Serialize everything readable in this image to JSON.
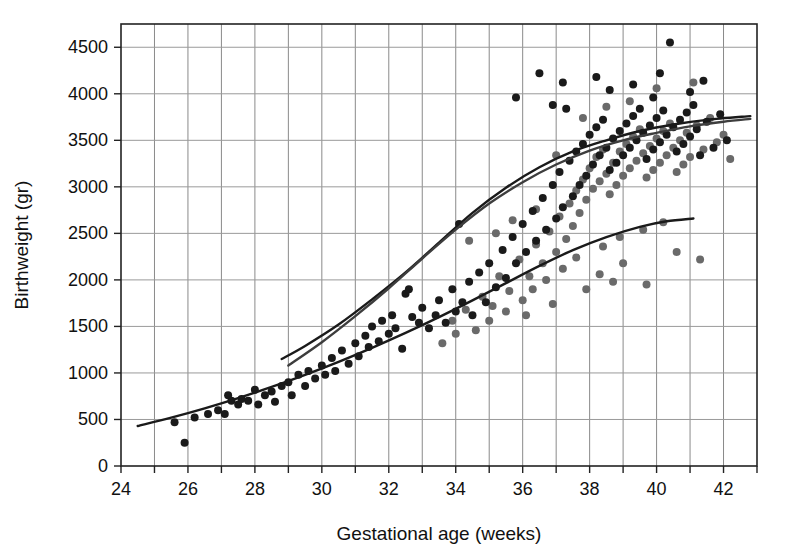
{
  "chart_data": {
    "type": "scatter",
    "title": "",
    "xlabel": "Gestational age (weeks)",
    "ylabel": "Birthweight (gr)",
    "xlim": [
      24,
      43
    ],
    "ylim": [
      0,
      4750
    ],
    "grid": true,
    "legend_position": "none",
    "x_ticks": [
      24,
      26,
      28,
      30,
      32,
      34,
      36,
      38,
      40,
      42
    ],
    "x_tick_labels": [
      "24",
      "26",
      "28",
      "30",
      "32",
      "34",
      "36",
      "38",
      "40",
      "42"
    ],
    "x_minor_step": 1,
    "y_ticks": [
      0,
      500,
      1000,
      1500,
      2000,
      2500,
      3000,
      3500,
      4000,
      4500
    ],
    "y_tick_labels": [
      "0",
      "500",
      "1000",
      "1500",
      "2000",
      "2500",
      "3000",
      "3500",
      "4000",
      "4500"
    ],
    "series": [
      {
        "name": "dark-points",
        "marker": "circle",
        "color": "#1a1a1a",
        "points": [
          [
            25.9,
            250
          ],
          [
            25.6,
            470
          ],
          [
            26.2,
            520
          ],
          [
            26.6,
            560
          ],
          [
            26.9,
            600
          ],
          [
            27.1,
            560
          ],
          [
            27.2,
            760
          ],
          [
            27.3,
            700
          ],
          [
            27.5,
            660
          ],
          [
            27.6,
            720
          ],
          [
            27.8,
            700
          ],
          [
            28.0,
            820
          ],
          [
            28.1,
            660
          ],
          [
            28.3,
            760
          ],
          [
            28.5,
            800
          ],
          [
            28.6,
            690
          ],
          [
            28.8,
            860
          ],
          [
            29.0,
            900
          ],
          [
            29.1,
            760
          ],
          [
            29.3,
            980
          ],
          [
            29.5,
            860
          ],
          [
            29.6,
            1020
          ],
          [
            29.8,
            940
          ],
          [
            30.0,
            1080
          ],
          [
            30.1,
            980
          ],
          [
            30.3,
            1160
          ],
          [
            30.4,
            1020
          ],
          [
            30.6,
            1240
          ],
          [
            30.8,
            1100
          ],
          [
            31.0,
            1320
          ],
          [
            31.1,
            1180
          ],
          [
            31.3,
            1400
          ],
          [
            31.4,
            1280
          ],
          [
            31.5,
            1500
          ],
          [
            31.7,
            1340
          ],
          [
            31.8,
            1560
          ],
          [
            32.0,
            1420
          ],
          [
            32.1,
            1620
          ],
          [
            32.2,
            1480
          ],
          [
            32.4,
            1260
          ],
          [
            32.5,
            1850
          ],
          [
            32.6,
            1900
          ],
          [
            32.7,
            1600
          ],
          [
            32.9,
            1540
          ],
          [
            33.0,
            1700
          ],
          [
            33.2,
            1480
          ],
          [
            33.4,
            1620
          ],
          [
            33.5,
            1780
          ],
          [
            33.7,
            1540
          ],
          [
            33.9,
            1900
          ],
          [
            34.0,
            1660
          ],
          [
            34.1,
            2600
          ],
          [
            34.2,
            1760
          ],
          [
            34.4,
            1980
          ],
          [
            34.5,
            1620
          ],
          [
            34.7,
            2080
          ],
          [
            34.9,
            1760
          ],
          [
            35.0,
            2180
          ],
          [
            35.2,
            1920
          ],
          [
            35.4,
            2320
          ],
          [
            35.5,
            2020
          ],
          [
            35.7,
            2460
          ],
          [
            35.8,
            2180
          ],
          [
            36.0,
            2600
          ],
          [
            36.1,
            2300
          ],
          [
            36.3,
            2740
          ],
          [
            36.4,
            2420
          ],
          [
            36.6,
            2880
          ],
          [
            36.7,
            2540
          ],
          [
            36.9,
            3020
          ],
          [
            37.0,
            2660
          ],
          [
            37.1,
            3160
          ],
          [
            37.2,
            2780
          ],
          [
            37.3,
            3840
          ],
          [
            37.4,
            3280
          ],
          [
            37.5,
            2900
          ],
          [
            37.6,
            3380
          ],
          [
            37.7,
            3020
          ],
          [
            37.8,
            3460
          ],
          [
            37.9,
            3120
          ],
          [
            38.0,
            3560
          ],
          [
            38.1,
            3240
          ],
          [
            38.2,
            3640
          ],
          [
            38.3,
            3340
          ],
          [
            38.4,
            3720
          ],
          [
            38.5,
            3420
          ],
          [
            38.6,
            3180
          ],
          [
            38.7,
            3520
          ],
          [
            38.8,
            3260
          ],
          [
            38.9,
            3600
          ],
          [
            39.0,
            3340
          ],
          [
            39.1,
            3680
          ],
          [
            39.2,
            3420
          ],
          [
            39.3,
            3760
          ],
          [
            39.4,
            3500
          ],
          [
            39.5,
            3840
          ],
          [
            39.6,
            3580
          ],
          [
            39.7,
            3300
          ],
          [
            39.8,
            3660
          ],
          [
            39.9,
            3400
          ],
          [
            40.0,
            3740
          ],
          [
            40.1,
            3480
          ],
          [
            40.2,
            3820
          ],
          [
            40.3,
            3560
          ],
          [
            40.4,
            4550
          ],
          [
            40.5,
            3640
          ],
          [
            40.6,
            3380
          ],
          [
            40.7,
            3720
          ],
          [
            40.8,
            3460
          ],
          [
            40.9,
            3800
          ],
          [
            41.0,
            3540
          ],
          [
            41.1,
            3880
          ],
          [
            41.2,
            3620
          ],
          [
            41.3,
            3340
          ],
          [
            41.5,
            3700
          ],
          [
            41.7,
            3420
          ],
          [
            41.9,
            3780
          ],
          [
            42.1,
            3500
          ],
          [
            36.5,
            4220
          ],
          [
            37.2,
            4120
          ],
          [
            38.2,
            4180
          ],
          [
            39.3,
            4100
          ],
          [
            40.1,
            4220
          ],
          [
            41.4,
            4140
          ],
          [
            35.8,
            3960
          ],
          [
            36.9,
            3880
          ],
          [
            38.6,
            4040
          ],
          [
            39.9,
            3960
          ],
          [
            41.0,
            4020
          ]
        ]
      },
      {
        "name": "gray-points",
        "marker": "circle",
        "color": "#6a6a6a",
        "points": [
          [
            33.9,
            1560
          ],
          [
            34.3,
            1680
          ],
          [
            34.8,
            1820
          ],
          [
            35.1,
            1720
          ],
          [
            35.3,
            2040
          ],
          [
            35.6,
            1880
          ],
          [
            35.9,
            2220
          ],
          [
            36.2,
            2040
          ],
          [
            36.4,
            2380
          ],
          [
            36.6,
            2180
          ],
          [
            36.8,
            2520
          ],
          [
            37.0,
            2300
          ],
          [
            37.1,
            2680
          ],
          [
            37.3,
            2440
          ],
          [
            37.4,
            2820
          ],
          [
            37.5,
            2580
          ],
          [
            37.6,
            2960
          ],
          [
            37.7,
            2720
          ],
          [
            37.8,
            3080
          ],
          [
            37.9,
            2860
          ],
          [
            38.0,
            3200
          ],
          [
            38.1,
            2980
          ],
          [
            38.2,
            3320
          ],
          [
            38.3,
            3060
          ],
          [
            38.4,
            3400
          ],
          [
            38.5,
            3140
          ],
          [
            38.6,
            2920
          ],
          [
            38.7,
            3260
          ],
          [
            38.8,
            3020
          ],
          [
            38.9,
            3380
          ],
          [
            39.0,
            3120
          ],
          [
            39.1,
            3460
          ],
          [
            39.2,
            3200
          ],
          [
            39.3,
            3540
          ],
          [
            39.4,
            3280
          ],
          [
            39.5,
            3620
          ],
          [
            39.6,
            3360
          ],
          [
            39.7,
            3100
          ],
          [
            39.8,
            3440
          ],
          [
            39.9,
            3180
          ],
          [
            40.0,
            3520
          ],
          [
            40.1,
            3260
          ],
          [
            40.2,
            3600
          ],
          [
            40.3,
            3340
          ],
          [
            40.4,
            3680
          ],
          [
            40.5,
            3420
          ],
          [
            40.6,
            3160
          ],
          [
            40.7,
            3500
          ],
          [
            40.8,
            3240
          ],
          [
            40.9,
            3580
          ],
          [
            41.0,
            3320
          ],
          [
            41.2,
            3660
          ],
          [
            41.4,
            3400
          ],
          [
            41.6,
            3740
          ],
          [
            41.8,
            3480
          ],
          [
            42.0,
            3560
          ],
          [
            42.2,
            3300
          ],
          [
            34.6,
            1460
          ],
          [
            35.0,
            1560
          ],
          [
            35.5,
            1660
          ],
          [
            36.0,
            1780
          ],
          [
            36.3,
            1900
          ],
          [
            36.7,
            2000
          ],
          [
            37.2,
            2120
          ],
          [
            36.1,
            1620
          ],
          [
            36.9,
            1740
          ],
          [
            37.6,
            2240
          ],
          [
            38.4,
            2360
          ],
          [
            38.9,
            2460
          ],
          [
            39.6,
            2540
          ],
          [
            40.2,
            2620
          ],
          [
            35.7,
            2640
          ],
          [
            36.4,
            2760
          ],
          [
            37.0,
            3340
          ],
          [
            37.8,
            3740
          ],
          [
            38.5,
            3860
          ],
          [
            39.2,
            3920
          ],
          [
            40.0,
            4060
          ],
          [
            41.1,
            4120
          ],
          [
            34.4,
            2420
          ],
          [
            35.2,
            2500
          ],
          [
            33.6,
            1320
          ],
          [
            34.0,
            1420
          ],
          [
            38.3,
            2060
          ],
          [
            39.0,
            2180
          ],
          [
            39.7,
            1950
          ],
          [
            38.7,
            1980
          ],
          [
            37.9,
            1900
          ],
          [
            40.6,
            2300
          ],
          [
            41.3,
            2220
          ]
        ]
      }
    ],
    "curves": [
      {
        "name": "lower-reference-curve",
        "color": "#1a1a1a",
        "x_start": 24.5,
        "x_end": 41.1,
        "points": [
          [
            24.5,
            430
          ],
          [
            25.5,
            520
          ],
          [
            26.5,
            620
          ],
          [
            27.5,
            730
          ],
          [
            28.5,
            850
          ],
          [
            29.5,
            980
          ],
          [
            30.5,
            1120
          ],
          [
            31.5,
            1270
          ],
          [
            32.5,
            1430
          ],
          [
            33.5,
            1600
          ],
          [
            34.5,
            1780
          ],
          [
            35.5,
            1965
          ],
          [
            36.5,
            2150
          ],
          [
            37.5,
            2320
          ],
          [
            38.5,
            2460
          ],
          [
            39.5,
            2570
          ],
          [
            40.3,
            2630
          ],
          [
            41.1,
            2660
          ]
        ]
      },
      {
        "name": "upper-reference-curve-a",
        "color": "#1a1a1a",
        "x_start": 28.8,
        "x_end": 42.8,
        "points": [
          [
            28.8,
            1150
          ],
          [
            29.5,
            1290
          ],
          [
            30.5,
            1520
          ],
          [
            31.5,
            1790
          ],
          [
            32.5,
            2080
          ],
          [
            33.5,
            2400
          ],
          [
            34.5,
            2720
          ],
          [
            35.5,
            2990
          ],
          [
            36.5,
            3210
          ],
          [
            37.5,
            3380
          ],
          [
            38.5,
            3500
          ],
          [
            39.5,
            3600
          ],
          [
            40.5,
            3670
          ],
          [
            41.5,
            3720
          ],
          [
            42.8,
            3760
          ]
        ]
      },
      {
        "name": "upper-reference-curve-b",
        "color": "#3d3d3d",
        "x_start": 29.0,
        "x_end": 42.8,
        "points": [
          [
            29.0,
            1080
          ],
          [
            30.0,
            1330
          ],
          [
            31.0,
            1610
          ],
          [
            32.0,
            1910
          ],
          [
            33.0,
            2230
          ],
          [
            34.0,
            2540
          ],
          [
            35.0,
            2820
          ],
          [
            36.0,
            3050
          ],
          [
            37.0,
            3240
          ],
          [
            38.0,
            3390
          ],
          [
            39.0,
            3500
          ],
          [
            40.0,
            3580
          ],
          [
            41.0,
            3650
          ],
          [
            42.0,
            3700
          ],
          [
            42.8,
            3730
          ]
        ]
      }
    ]
  },
  "axes": {
    "x_title": "Gestational age (weeks)",
    "y_title": "Birthweight (gr)"
  }
}
